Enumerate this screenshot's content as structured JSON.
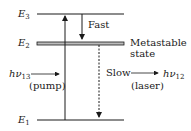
{
  "levels": {
    "e3": {
      "symbol": "E",
      "sub": "3"
    },
    "e2": {
      "symbol": "E",
      "sub": "2"
    },
    "e1": {
      "symbol": "E",
      "sub": "1"
    }
  },
  "transitions": {
    "fast": "Fast",
    "metastable_line1": "Metastable",
    "metastable_line2": "state",
    "slow": "Slow",
    "pump_symbol": "hν",
    "pump_sub": "13",
    "pump_label": "(pump)",
    "laser_symbol": "hν",
    "laser_sub": "12",
    "laser_label": "(laser)"
  }
}
